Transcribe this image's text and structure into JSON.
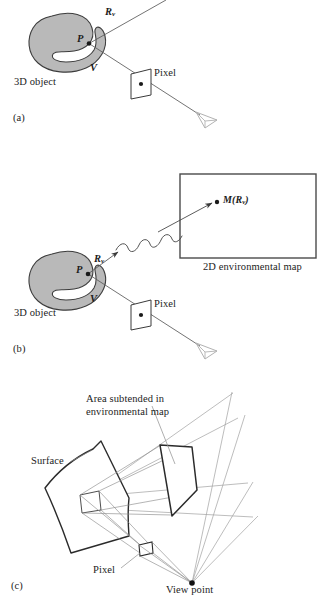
{
  "figure": {
    "type": "diagram",
    "background_color": "#ffffff",
    "ink_color": "#1c1c1c",
    "blob_fill": "#b9b9b9",
    "blob_stroke": "#3a3a3a",
    "ray_color": "#555555",
    "faint_ray_color": "#9a9a9a",
    "eye_color": "#b0b0b0"
  },
  "panels": [
    {
      "id": "a",
      "letter": "(a)",
      "labels": {
        "reflection_vector": "R",
        "reflection_vector_sub": "v",
        "point": "P",
        "view_vector": "V",
        "pixel": "Pixel",
        "object": "3D object"
      }
    },
    {
      "id": "b",
      "letter": "(b)",
      "labels": {
        "reflection_vector": "R",
        "reflection_vector_sub": "v",
        "point": "P",
        "view_vector": "V",
        "pixel": "Pixel",
        "object": "3D object",
        "map_sample": "M(R",
        "map_sample_sub": "v",
        "map_sample_close": ")",
        "map_caption": "2D environmental map"
      }
    },
    {
      "id": "c",
      "letter": "(c)",
      "labels": {
        "area_line1": "Area subtended in",
        "area_line2": "environmental map",
        "surface": "Surface",
        "pixel": "Pixel",
        "view_point": "View point"
      }
    }
  ]
}
